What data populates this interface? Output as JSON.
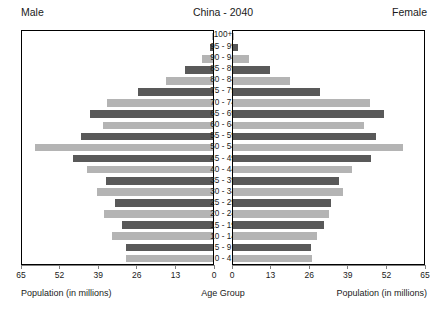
{
  "header": {
    "left_label": "Male",
    "title": "China - 2040",
    "right_label": "Female"
  },
  "footer": {
    "left_caption": "Population (in millions)",
    "center_caption": "Age Group",
    "right_caption": "Population (in millions)"
  },
  "axis": {
    "left_ticks": [
      "65",
      "52",
      "39",
      "26",
      "13",
      "0"
    ],
    "right_ticks": [
      "0",
      "13",
      "26",
      "39",
      "52",
      "65"
    ]
  },
  "colors": {
    "dark_bar": "#595959",
    "light_bar": "#b4b4b4",
    "panel_border": "#000000",
    "axis_line": "#808080",
    "text": "#1a1a1a",
    "background": "#ffffff"
  },
  "chart_data": {
    "type": "bar",
    "title": "China - 2040",
    "subtitle": "",
    "xlabel": "Population (in millions)",
    "ylabel": "Age Group",
    "xlim": [
      0,
      65
    ],
    "grid": false,
    "legend": [
      "Male",
      "Female"
    ],
    "legend_position": "top-left and top-right",
    "orientation": "horizontal-diverging",
    "categories": [
      "100+",
      "95 - 99",
      "90 - 94",
      "85 - 89",
      "80 - 84",
      "75 - 79",
      "70 - 74",
      "65 - 69",
      "60 - 64",
      "55 - 59",
      "50 - 54",
      "45 - 49",
      "40 - 44",
      "35 - 39",
      "30 - 34",
      "25 - 29",
      "20 - 24",
      "15 - 19",
      "10 - 14",
      "5 - 9",
      "0 - 4"
    ],
    "series": [
      {
        "name": "Male",
        "side": "left",
        "values": [
          0.2,
          1.0,
          3.6,
          9.5,
          16.0,
          25.5,
          36.0,
          42.0,
          37.5,
          45.0,
          60.5,
          47.5,
          43.0,
          36.5,
          39.5,
          33.5,
          37.0,
          31.0,
          34.5,
          29.5,
          29.5
        ]
      },
      {
        "name": "Female",
        "side": "right",
        "values": [
          0.4,
          1.8,
          5.5,
          12.5,
          19.5,
          29.5,
          46.5,
          51.5,
          44.5,
          48.5,
          58.0,
          47.0,
          40.5,
          36.0,
          37.5,
          33.5,
          32.5,
          31.0,
          28.5,
          26.5,
          27.0
        ]
      }
    ],
    "bar_shading_pattern": [
      "light",
      "dark"
    ]
  }
}
